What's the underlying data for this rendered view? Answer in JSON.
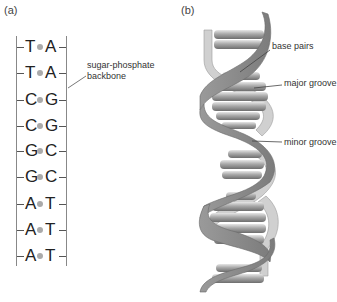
{
  "panel_a": {
    "label": "(a)",
    "pairs": [
      {
        "left": "T",
        "right": "A"
      },
      {
        "left": "T",
        "right": "A"
      },
      {
        "left": "C",
        "right": "G"
      },
      {
        "left": "C",
        "right": "G"
      },
      {
        "left": "G",
        "right": "C"
      },
      {
        "left": "G",
        "right": "C"
      },
      {
        "left": "A",
        "right": "T"
      },
      {
        "left": "A",
        "right": "T"
      },
      {
        "left": "A",
        "right": "T"
      }
    ],
    "backbone_label_line1": "sugar-phosphate",
    "backbone_label_line2": "backbone"
  },
  "panel_b": {
    "label": "(b)",
    "annotations": {
      "base_pairs": "base pairs",
      "major_groove": "major groove",
      "minor_groove": "minor groove"
    }
  },
  "colors": {
    "ribbon": "#8a8a8a",
    "ribbon_light": "#c8c8c8",
    "rung": "#9a9a9a",
    "dot": "#aaaaaa"
  }
}
